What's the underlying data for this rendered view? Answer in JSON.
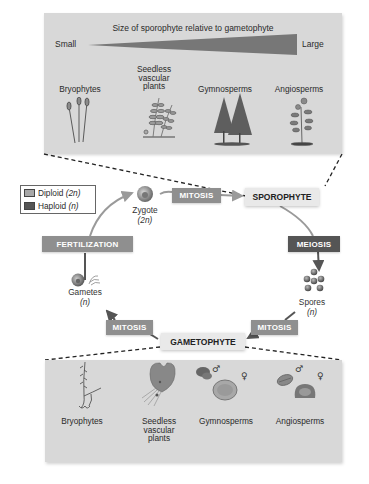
{
  "top_panel": {
    "title": "Size of sporophyte relative to gametophyte",
    "scale_min": "Small",
    "scale_max": "Large",
    "groups": [
      {
        "label_lines": [
          "Bryophytes"
        ],
        "icon": "moss-sporophyte-icon"
      },
      {
        "label_lines": [
          "Seedless",
          "vascular",
          "plants"
        ],
        "icon": "fern-icon"
      },
      {
        "label_lines": [
          "Gymnosperms"
        ],
        "icon": "conifer-trees-icon"
      },
      {
        "label_lines": [
          "Angiosperms"
        ],
        "icon": "flowering-plant-icon"
      }
    ]
  },
  "legend": {
    "items": [
      {
        "label": "Diploid",
        "ploidy": "(2n)",
        "color": "#8f8f8f"
      },
      {
        "label": "Haploid",
        "ploidy": "(n)",
        "color": "#555555"
      }
    ]
  },
  "cycle": {
    "sporophyte": "SPOROPHYTE",
    "gametophyte": "GAMETOPHYTE",
    "zygote": {
      "label": "Zygote",
      "ploidy": "(2n)"
    },
    "spores": {
      "label": "Spores",
      "ploidy": "(n)"
    },
    "gametes": {
      "label": "Gametes",
      "ploidy": "(n)"
    },
    "processes": {
      "mitosis_top": "MITOSIS",
      "meiosis": "MEIOSIS",
      "mitosis_right": "MITOSIS",
      "mitosis_left": "MITOSIS",
      "fertilization": "FERTILIZATION"
    }
  },
  "bottom_panel": {
    "groups": [
      {
        "label_lines": [
          "Bryophytes"
        ],
        "icon": "moss-gametophyte-icon"
      },
      {
        "label_lines": [
          "Seedless",
          "vascular",
          "plants"
        ],
        "icon": "fern-prothallus-icon"
      },
      {
        "label_lines": [
          "Gymnosperms"
        ],
        "icon": "pollen-ovule-icon",
        "symbols": [
          "♂",
          "♀"
        ]
      },
      {
        "label_lines": [
          "Angiosperms"
        ],
        "icon": "pollen-embryo-sac-icon",
        "symbols": [
          "♂",
          "♀"
        ]
      }
    ]
  },
  "colors": {
    "panel_bg": "#d8d8d8",
    "diploid": "#8f8f8f",
    "haploid": "#555555",
    "stage_bg": "#e9e9e9",
    "arrow": "#9a9a9a"
  }
}
